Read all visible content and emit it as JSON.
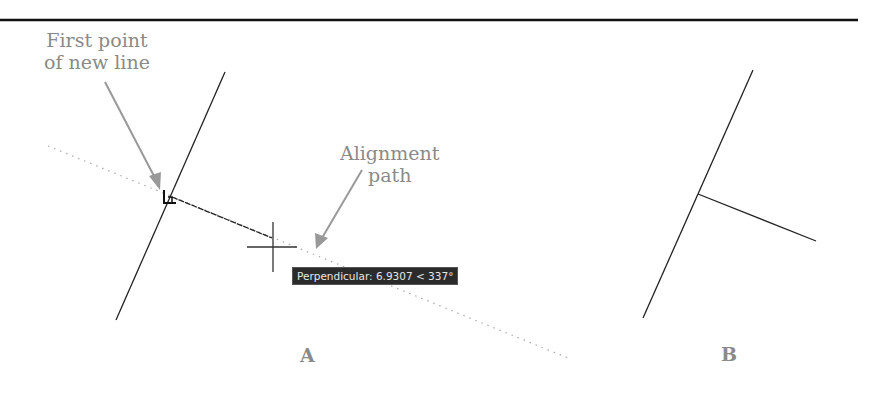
{
  "callouts": {
    "first_point": "First point\nof new line",
    "first_point_line1": "First point",
    "first_point_line2": "of new line",
    "alignment_line1": "Alignment",
    "alignment_line2": "path"
  },
  "tooltip": {
    "text": "Perpendicular: 6.9307 < 337°"
  },
  "panels": {
    "a_label": "A",
    "b_label": "B"
  },
  "colors": {
    "line": "#222222",
    "callout_text": "#8a8a8a",
    "arrow": "#999999",
    "tracking": "#aaaaaa",
    "tooltip_bg": "#2b2b2b",
    "rule": "#111111"
  }
}
